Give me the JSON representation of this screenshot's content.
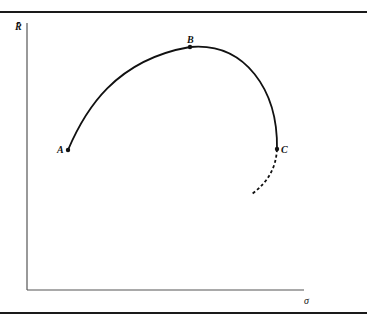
{
  "figure": {
    "axes": {
      "y_label": "R̄",
      "x_label": "σ"
    },
    "points": [
      {
        "id": "A",
        "label": "A",
        "x": 68,
        "y": 150
      },
      {
        "id": "B",
        "label": "B",
        "x": 190,
        "y": 47
      },
      {
        "id": "C",
        "label": "C",
        "x": 277,
        "y": 149
      }
    ],
    "curve": {
      "solid": "A-B-C efficient frontier curve",
      "dashed": "continuation below C"
    },
    "colors": {
      "ink": "#111111",
      "axis": "#555555",
      "background": "#ffffff"
    }
  }
}
